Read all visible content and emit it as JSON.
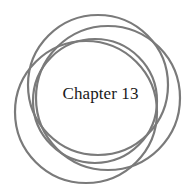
{
  "title": "Chapter 13",
  "colors": {
    "background": "#ffffff",
    "ring_stroke": "#7a7a7a",
    "text": "#1a1a1a"
  },
  "rings": [
    {
      "cx": 98,
      "cy": 85,
      "r": 70
    },
    {
      "cx": 108,
      "cy": 98,
      "r": 72
    },
    {
      "cx": 86,
      "cy": 112,
      "r": 71
    },
    {
      "cx": 95,
      "cy": 101,
      "r": 62
    }
  ]
}
